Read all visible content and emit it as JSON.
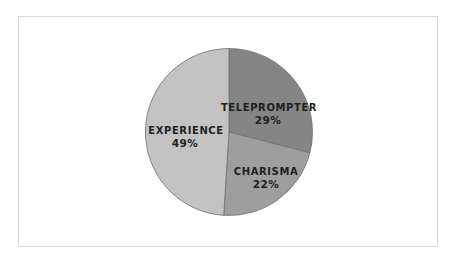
{
  "chart_data": {
    "type": "pie",
    "title": "",
    "categories": [
      "TELEPROMPTER",
      "CHARISMA",
      "EXPERIENCE"
    ],
    "values": [
      29,
      22,
      49
    ],
    "unit": "%",
    "labels": [
      "29%",
      "22%",
      "49%"
    ],
    "colors": [
      "#858585",
      "#9e9e9e",
      "#c2c2c2"
    ],
    "start_angle": "12 o'clock",
    "direction": "clockwise",
    "legend": "none",
    "data_labels": "inside, category name + percentage"
  },
  "slices": [
    {
      "name": "TELEPROMPTER",
      "value_label": "29%",
      "color": "#858585"
    },
    {
      "name": "CHARISMA",
      "value_label": "22%",
      "color": "#9e9e9e"
    },
    {
      "name": "EXPERIENCE",
      "value_label": "49%",
      "color": "#c2c2c2"
    }
  ],
  "style": {
    "border_color": "#d9d9d9",
    "slice_stroke": "#6e6e6e",
    "label_color": "#1f1f1f"
  }
}
